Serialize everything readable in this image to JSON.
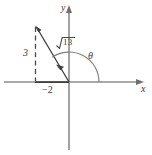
{
  "figure": {
    "background_color": "#ffffff",
    "axis_color": "#8c8c8c",
    "line_color": "#4a4a4a",
    "text_color": "#3b3b3b",
    "width": 152,
    "height": 155
  },
  "axes": {
    "x_label": "x",
    "y_label": "y",
    "origin": {
      "x": 69,
      "y": 82
    },
    "x_axis_from": {
      "x": 4,
      "y": 82
    },
    "x_axis_to": {
      "x": 140,
      "y": 82
    },
    "y_axis_from": {
      "x": 69,
      "y": 148
    },
    "y_axis_to": {
      "x": 69,
      "y": 8
    }
  },
  "point": {
    "x_value": -2,
    "y_value": 3,
    "pixel": {
      "x": 35,
      "y": 26
    }
  },
  "labels": {
    "opposite_side": "3",
    "adjacent_side": "−2",
    "hypotenuse_radicand": "13",
    "hypotenuse_full": "√13",
    "angle": "θ"
  },
  "segments": {
    "vertical_dashed": {
      "from": {
        "x": 35,
        "y": 27
      },
      "to": {
        "x": 35,
        "y": 82
      },
      "style": "dashed"
    },
    "horizontal_base": {
      "from": {
        "x": 35,
        "y": 82
      },
      "to": {
        "x": 69,
        "y": 82
      },
      "style": "solid"
    },
    "terminal_ray": {
      "from": {
        "x": 69,
        "y": 82
      },
      "to": {
        "x": 36,
        "y": 26
      },
      "style": "solid",
      "arrow": "at-point-end"
    }
  },
  "angle_arc": {
    "center": {
      "x": 69,
      "y": 82
    },
    "radius": 30,
    "start_deg": 0,
    "end_deg": 124,
    "direction": "counterclockwise"
  },
  "math": {
    "r": "√13",
    "x": "-2",
    "y": "3"
  }
}
